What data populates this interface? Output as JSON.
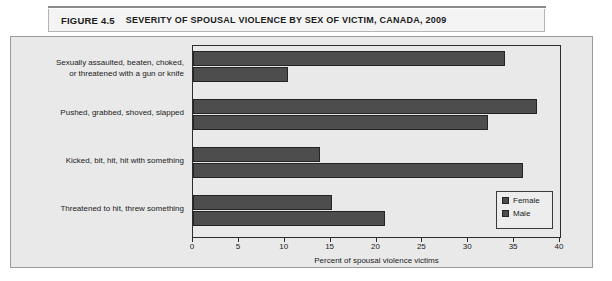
{
  "figure": {
    "number_label": "FIGURE 4.5",
    "title": "SEVERITY OF SPOUSAL VIOLENCE BY SEX OF VICTIM, CANADA, 2009"
  },
  "colors": {
    "bar_fill": "#4d4d4d",
    "bar_border": "#242424",
    "plot_background": "#e9e9e9",
    "axis": "#2d2d2d"
  },
  "chart_data": {
    "type": "bar",
    "orientation": "horizontal",
    "title": "SEVERITY OF SPOUSAL VIOLENCE BY SEX OF VICTIM, CANADA, 2009",
    "xlabel": "Percent of spousal violence victims",
    "ylabel": "",
    "xlim": [
      0,
      40
    ],
    "xticks": [
      0,
      5,
      10,
      15,
      20,
      25,
      30,
      35,
      40
    ],
    "xtick_labels": [
      "0",
      "5",
      "10",
      "15",
      "20",
      "25",
      "30",
      "35",
      "40"
    ],
    "grid": false,
    "legend_position": "lower right",
    "categories": [
      "Sexually assaulted, beaten, choked,\nor threatened with a gun or knife",
      "Pushed, grabbed, shoved, slapped",
      "Kicked, bit, hit, hit with something",
      "Threatened to hit, threw something"
    ],
    "series": [
      {
        "name": "Female",
        "values": [
          34.0,
          37.5,
          13.8,
          15.2
        ]
      },
      {
        "name": "Male",
        "values": [
          10.4,
          32.2,
          36.0,
          20.9
        ]
      }
    ]
  },
  "axis": {
    "label": "Percent of spousal violence victims"
  },
  "legend": {
    "items": [
      {
        "label": "Female"
      },
      {
        "label": "Male"
      }
    ]
  }
}
